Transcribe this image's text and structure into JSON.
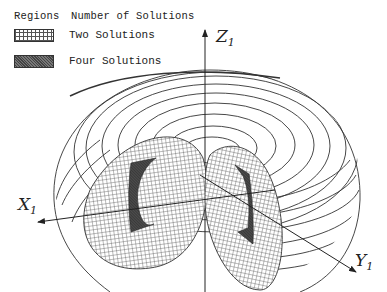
{
  "legend": {
    "header_regions": "Regions",
    "header_solutions": "Number of Solutions",
    "items": [
      {
        "pattern": "crosshatch",
        "label": "Two Solutions"
      },
      {
        "pattern": "dense-dark",
        "label": "Four Solutions"
      }
    ]
  },
  "axes": {
    "z": {
      "letter": "Z",
      "subscript": "1"
    },
    "x": {
      "letter": "X",
      "subscript": "1"
    },
    "y": {
      "letter": "Y",
      "subscript": "1"
    }
  },
  "colors": {
    "line": "#333333",
    "crosshatch": "#555555",
    "four_region": "#444444",
    "background": "#ffffff"
  }
}
